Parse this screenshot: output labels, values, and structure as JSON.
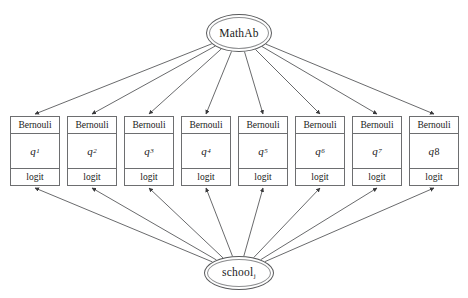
{
  "diagram": {
    "type": "path-diagram",
    "background": "#ffffff",
    "line_color": "#58595b",
    "canvas": {
      "width": 468,
      "height": 298
    },
    "top_node": {
      "label": "MathAb",
      "shape": "ellipse",
      "cx": 239,
      "cy": 33,
      "rx": 33,
      "ry": 19
    },
    "bottom_node": {
      "label": "school",
      "subscript": "j",
      "shape": "ellipse",
      "cx": 239,
      "cy": 273,
      "rx": 35,
      "ry": 17
    },
    "indicator_boxes": [
      {
        "distribution": "Bernouli",
        "parameter": "q",
        "index": "1",
        "index_style": "subscript",
        "link": "logit"
      },
      {
        "distribution": "Bernouli",
        "parameter": "q",
        "index": "2",
        "index_style": "subscript",
        "link": "logit"
      },
      {
        "distribution": "Bernouli",
        "parameter": "q",
        "index": "3",
        "index_style": "subscript",
        "link": "logit"
      },
      {
        "distribution": "Bernouli",
        "parameter": "q",
        "index": "4",
        "index_style": "subscript",
        "link": "logit"
      },
      {
        "distribution": "Bernouli",
        "parameter": "q",
        "index": "5",
        "index_style": "subscript",
        "link": "logit"
      },
      {
        "distribution": "Bernouli",
        "parameter": "q",
        "index": "6",
        "index_style": "subscript",
        "link": "logit"
      },
      {
        "distribution": "Bernouli",
        "parameter": "q",
        "index": "7",
        "index_style": "subscript",
        "link": "logit"
      },
      {
        "distribution": "Bernouli",
        "parameter": "q",
        "index": "8",
        "index_style": "inline",
        "link": "logit"
      }
    ],
    "edges": {
      "from_top_count": 8,
      "from_bottom_count": 8,
      "arrowhead": "filled-triangle",
      "top_source_label": "MathAb",
      "bottom_source_label": "school"
    }
  }
}
